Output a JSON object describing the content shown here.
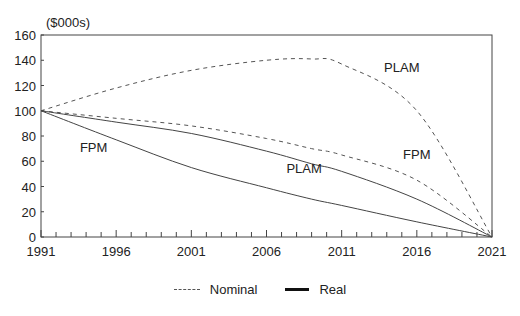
{
  "chart_data": {
    "type": "line",
    "title": "",
    "ylabel": "($000s)",
    "xlabel": "",
    "xlim": [
      1991,
      2021
    ],
    "ylim": [
      0,
      160
    ],
    "x_ticks": [
      "1991",
      "1996",
      "2001",
      "2006",
      "2011",
      "2016",
      "2021"
    ],
    "y_ticks": [
      "0",
      "20",
      "40",
      "60",
      "80",
      "100",
      "120",
      "140",
      "160"
    ],
    "grid": false,
    "legend_position": "bottom",
    "x": [
      1991,
      1996,
      2001,
      2006,
      2009,
      2011,
      2016,
      2021
    ],
    "series": [
      {
        "name": "Nominal PLAM",
        "style": "dashed",
        "values": [
          100,
          118,
          132,
          140,
          141,
          137,
          100,
          0
        ]
      },
      {
        "name": "Nominal FPM",
        "style": "dashed",
        "values": [
          100,
          94,
          88,
          78,
          70,
          65,
          45,
          0
        ]
      },
      {
        "name": "Real FPM",
        "style": "solid",
        "values": [
          100,
          91,
          82,
          68,
          58,
          52,
          30,
          0
        ]
      },
      {
        "name": "Real PLAM",
        "style": "solid",
        "values": [
          100,
          77,
          55,
          39,
          30,
          25,
          12,
          0
        ]
      }
    ],
    "annotations": [
      {
        "text": "PLAM",
        "x": 2015,
        "y": 131
      },
      {
        "text": "FPM",
        "x": 2016,
        "y": 62
      },
      {
        "text": "PLAM",
        "x": 2008.5,
        "y": 51
      },
      {
        "text": "FPM",
        "x": 1994.5,
        "y": 67
      }
    ],
    "legend": [
      {
        "label": "Nominal",
        "style": "dashed"
      },
      {
        "label": "Real",
        "style": "solid"
      }
    ]
  }
}
